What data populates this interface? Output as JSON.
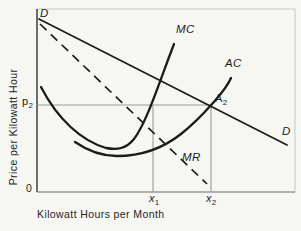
{
  "figure": {
    "axes": {
      "y_label": "Price per Kilowatt Hour",
      "x_label": "Kilowatt Hours per Month",
      "origin": "0"
    },
    "labels": {
      "demand_top": "D",
      "demand_right": "D",
      "marginal_cost": "MC",
      "average_cost": "AC",
      "marginal_revenue": "MR",
      "price": {
        "base": "p",
        "sub": "2"
      },
      "point_a": {
        "base": "A",
        "sub": "2"
      },
      "quantity_1": {
        "base": "x",
        "sub": "1"
      },
      "quantity_2": {
        "base": "x",
        "sub": "2"
      }
    },
    "colors": {
      "background": "#f6f6f3",
      "curve": "#1b1b1b",
      "guide": "#9a9a9a",
      "frame": "#c6c6c6",
      "axis_left": "#3c3c3c",
      "axis_bottom": "#848484"
    }
  }
}
